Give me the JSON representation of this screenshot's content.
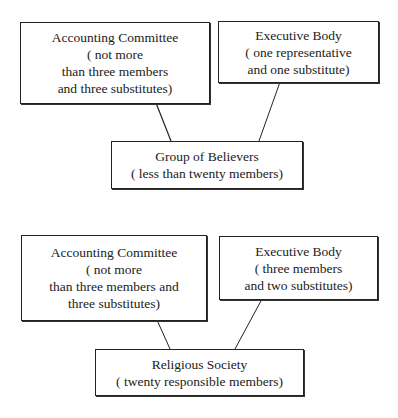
{
  "diagrams": [
    {
      "left_box": {
        "lines": [
          "Accounting Committee",
          "( not more",
          "than three members",
          "and three substitutes)"
        ]
      },
      "right_box": {
        "lines": [
          "Executive Body",
          "( one representative",
          "and one substitute)"
        ]
      },
      "bottom_box": {
        "lines": [
          "Group of Believers",
          "( less than twenty members)"
        ]
      }
    },
    {
      "left_box": {
        "lines": [
          "Accounting Committee",
          "( not more",
          "than three members and",
          "three substitutes)"
        ]
      },
      "right_box": {
        "lines": [
          "Executive Body",
          "( three members",
          "and two substitutes)"
        ]
      },
      "bottom_box": {
        "lines": [
          "Religious Society",
          "( twenty responsible members)"
        ]
      }
    }
  ]
}
